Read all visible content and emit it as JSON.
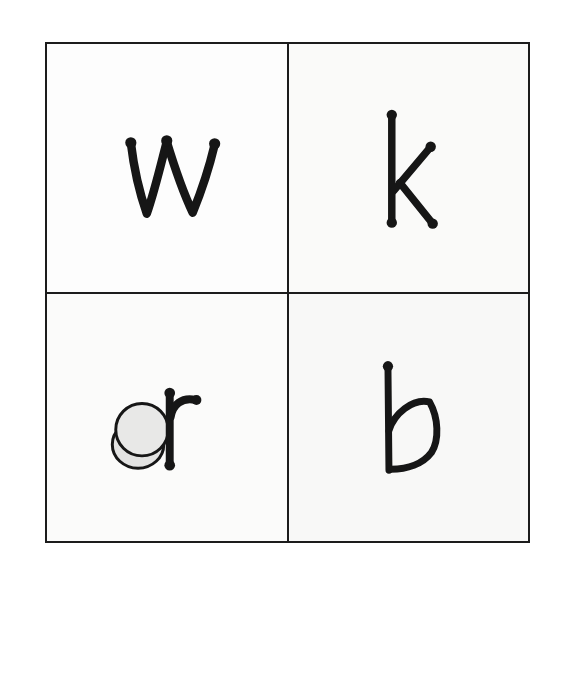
{
  "page": {
    "background_color": "#ffffff",
    "grid_line_color": "#1c1c1c"
  },
  "grid": {
    "rows": 2,
    "columns": 2,
    "cells": [
      {
        "letter": "w",
        "position": "top-left",
        "has_counter": false
      },
      {
        "letter": "k",
        "position": "top-right",
        "has_counter": false
      },
      {
        "letter": "r",
        "position": "bottom-left",
        "has_counter": true,
        "counter_color": "#e8e8e7"
      },
      {
        "letter": "b",
        "position": "bottom-right",
        "has_counter": false
      }
    ]
  },
  "objects_row": {
    "items": [
      {
        "name": "toy car",
        "kind": "car",
        "body_color": "#595959",
        "roof_color": "#4b4b4b",
        "window_color": "#f4f4f3"
      },
      {
        "name": "round counter",
        "kind": "counter",
        "color": "#ededec"
      },
      {
        "name": "rabbit counter",
        "kind": "rabbit",
        "color": "#dcdcdb"
      },
      {
        "name": "round counter",
        "kind": "counter",
        "color": "#c6c6c5"
      }
    ]
  }
}
